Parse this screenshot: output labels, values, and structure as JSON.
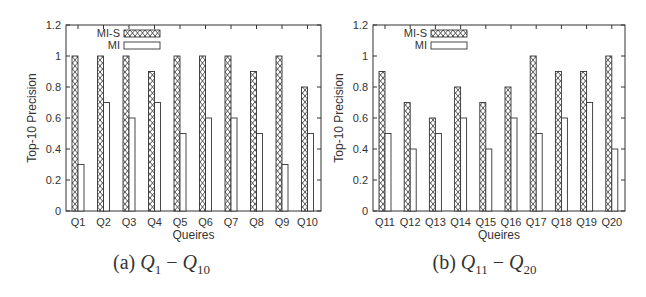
{
  "chart_data": [
    {
      "type": "bar",
      "title": "",
      "caption_label": "(a)",
      "caption_from": "Q",
      "caption_from_sub": "1",
      "caption_to": "Q",
      "caption_to_sub": "10",
      "xlabel": "Queires",
      "ylabel": "Top-10 Precision",
      "ylim": [
        0,
        1.2
      ],
      "yticks": [
        "0",
        "0.2",
        "0.4",
        "0.6",
        "0.8",
        "1",
        "1.2"
      ],
      "grid": false,
      "legend_position": "top-left (inside)",
      "categories": [
        "Q1",
        "Q2",
        "Q3",
        "Q4",
        "Q5",
        "Q6",
        "Q7",
        "Q8",
        "Q9",
        "Q10"
      ],
      "series": [
        {
          "name": "MI-S",
          "pattern": "crosshatch",
          "values": [
            1.0,
            1.0,
            1.0,
            0.9,
            1.0,
            1.0,
            1.0,
            0.9,
            1.0,
            0.8
          ]
        },
        {
          "name": "MI",
          "pattern": "empty",
          "values": [
            0.3,
            0.7,
            0.6,
            0.7,
            0.5,
            0.6,
            0.6,
            0.5,
            0.3,
            0.5
          ]
        }
      ]
    },
    {
      "type": "bar",
      "title": "",
      "caption_label": "(b)",
      "caption_from": "Q",
      "caption_from_sub": "11",
      "caption_to": "Q",
      "caption_to_sub": "20",
      "xlabel": "Queires",
      "ylabel": "Top-10 Precision",
      "ylim": [
        0,
        1.2
      ],
      "yticks": [
        "0",
        "0.2",
        "0.4",
        "0.6",
        "0.8",
        "1",
        "1.2"
      ],
      "grid": false,
      "legend_position": "top-left (inside)",
      "categories": [
        "Q11",
        "Q12",
        "Q13",
        "Q14",
        "Q15",
        "Q16",
        "Q17",
        "Q18",
        "Q19",
        "Q20"
      ],
      "series": [
        {
          "name": "MI-S",
          "pattern": "crosshatch",
          "values": [
            0.9,
            0.7,
            0.6,
            0.8,
            0.7,
            0.8,
            1.0,
            0.9,
            0.9,
            1.0
          ]
        },
        {
          "name": "MI",
          "pattern": "empty",
          "values": [
            0.5,
            0.4,
            0.5,
            0.6,
            0.4,
            0.6,
            0.5,
            0.6,
            0.7,
            0.4
          ]
        }
      ]
    }
  ],
  "colors": {
    "axis": "#333333",
    "bar_stroke": "#333333",
    "bar_fill_empty": "#ffffff",
    "text": "#222222"
  }
}
